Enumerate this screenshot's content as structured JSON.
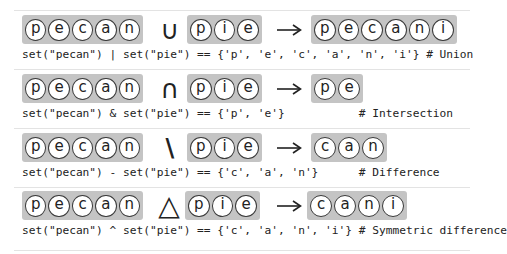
{
  "operands": {
    "left": [
      "p",
      "e",
      "c",
      "a",
      "n"
    ],
    "right": [
      "p",
      "i",
      "e"
    ]
  },
  "rows": [
    {
      "operation": "Union",
      "symbol": "∪",
      "result": [
        "p",
        "e",
        "c",
        "a",
        "n",
        "i"
      ],
      "code": "set(\"pecan\") | set(\"pie\") == {'p', 'e', 'c', 'a', 'n', 'i'} # Union"
    },
    {
      "operation": "Intersection",
      "symbol": "∩",
      "result": [
        "p",
        "e"
      ],
      "code": "set(\"pecan\") & set(\"pie\") == {'p', 'e'}           # Intersection"
    },
    {
      "operation": "Difference",
      "symbol": "\\",
      "result": [
        "c",
        "a",
        "n"
      ],
      "code": "set(\"pecan\") - set(\"pie\") == {'c', 'a', 'n'}      # Difference"
    },
    {
      "operation": "Symmetric difference",
      "symbol": "△",
      "result": [
        "c",
        "a",
        "n",
        "i"
      ],
      "code": "set(\"pecan\") ^ set(\"pie\") == {'c', 'a', 'n', 'i'} # Symmetric difference"
    }
  ],
  "arrow_icon": "right-arrow-icon",
  "colors": {
    "box_fill": "#c4c4c4",
    "chip_fill": "#ffffff",
    "chip_border": "#3a3a3a",
    "text": "#222222",
    "separator": "#e3e3e3"
  }
}
